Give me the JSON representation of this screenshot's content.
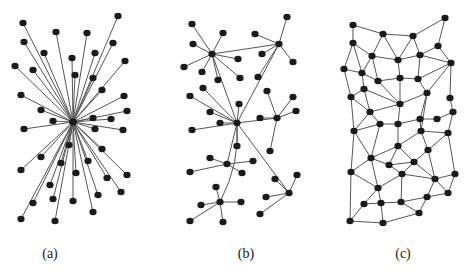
{
  "figure": {
    "colors": {
      "edge": "#555555",
      "node": "#1a1a1a",
      "background": "#ffffff"
    },
    "node_radius": 3.2,
    "panels": [
      {
        "id": "a",
        "label": "(a)",
        "label_x": 50,
        "type": "centralized",
        "hub": [
          73,
          122
        ],
        "leaves": [
          [
            23,
            23
          ],
          [
            118,
            16
          ],
          [
            56,
            32
          ],
          [
            87,
            33
          ],
          [
            24,
            42
          ],
          [
            113,
            43
          ],
          [
            44,
            53
          ],
          [
            95,
            53
          ],
          [
            72,
            58
          ],
          [
            125,
            61
          ],
          [
            15,
            66
          ],
          [
            33,
            70
          ],
          [
            75,
            75
          ],
          [
            93,
            78
          ],
          [
            102,
            90
          ],
          [
            21,
            95
          ],
          [
            124,
            96
          ],
          [
            41,
            110
          ],
          [
            127,
            111
          ],
          [
            53,
            121
          ],
          [
            93,
            118
          ],
          [
            111,
            119
          ],
          [
            24,
            129
          ],
          [
            95,
            129
          ],
          [
            123,
            130
          ],
          [
            69,
            145
          ],
          [
            102,
            149
          ],
          [
            41,
            157
          ],
          [
            61,
            163
          ],
          [
            88,
            161
          ],
          [
            21,
            170
          ],
          [
            127,
            175
          ],
          [
            76,
            173
          ],
          [
            107,
            178
          ],
          [
            50,
            185
          ],
          [
            53,
            199
          ],
          [
            121,
            192
          ],
          [
            33,
            203
          ],
          [
            73,
            201
          ],
          [
            98,
            195
          ],
          [
            93,
            212
          ],
          [
            21,
            219
          ],
          [
            55,
            221
          ]
        ]
      },
      {
        "id": "b",
        "label": "(b)",
        "label_x": 246,
        "type": "decentralized",
        "hubs": [
          {
            "at": [
              212,
              54
            ],
            "leaves": [
              [
                192,
                24
              ],
              [
                223,
                33
              ],
              [
                193,
                44
              ],
              [
                184,
                67
              ],
              [
                202,
                72
              ],
              [
                218,
                80
              ],
              [
                238,
                59
              ],
              [
                240,
                78
              ]
            ]
          },
          {
            "at": [
              279,
              44
            ],
            "leaves": [
              [
                287,
                17
              ],
              [
                255,
                34
              ],
              [
                262,
                54
              ],
              [
                293,
                62
              ],
              [
                258,
                77
              ]
            ]
          },
          {
            "at": [
              237,
              123
            ],
            "leaves": [
              [
                203,
                88
              ],
              [
                190,
                96
              ],
              [
                210,
                112
              ],
              [
                220,
                123
              ],
              [
                192,
                130
              ],
              [
                239,
                104
              ],
              [
                237,
                146
              ]
            ]
          },
          {
            "at": [
              277,
              118
            ],
            "leaves": [
              [
                267,
                91
              ],
              [
                293,
                97
              ],
              [
                296,
                111
              ],
              [
                260,
                118
              ],
              [
                270,
                151
              ]
            ]
          },
          {
            "at": [
              227,
              164
            ],
            "leaves": [
              [
                210,
                158
              ],
              [
                190,
                172
              ],
              [
                253,
                161
              ],
              [
                242,
                173
              ]
            ]
          },
          {
            "at": [
              220,
              202
            ],
            "leaves": [
              [
                216,
                187
              ],
              [
                201,
                205
              ],
              [
                241,
                202
              ],
              [
                190,
                221
              ],
              [
                223,
                222
              ]
            ]
          },
          {
            "at": [
              289,
              193
            ],
            "leaves": [
              [
                275,
                179
              ],
              [
                297,
                175
              ],
              [
                266,
                197
              ],
              [
                260,
                214
              ]
            ]
          }
        ],
        "hub_links": [
          [
            0,
            1
          ],
          [
            0,
            2
          ],
          [
            1,
            2
          ],
          [
            2,
            3
          ],
          [
            2,
            4
          ],
          [
            2,
            6
          ]
        ],
        "curved_links": [
          [
            2,
            5
          ]
        ]
      },
      {
        "id": "c",
        "label": "(c)",
        "label_x": 403,
        "type": "distributed",
        "nodes": [
          [
            353,
            25
          ],
          [
            445,
            18
          ],
          [
            383,
            34
          ],
          [
            413,
            36
          ],
          [
            353,
            43
          ],
          [
            438,
            46
          ],
          [
            372,
            56
          ],
          [
            398,
            60
          ],
          [
            420,
            55
          ],
          [
            451,
            63
          ],
          [
            344,
            69
          ],
          [
            362,
            73
          ],
          [
            378,
            81
          ],
          [
            400,
            78
          ],
          [
            418,
            79
          ],
          [
            364,
            89
          ],
          [
            427,
            93
          ],
          [
            351,
            97
          ],
          [
            450,
            98
          ],
          [
            400,
            104
          ],
          [
            370,
            112
          ],
          [
            453,
            112
          ],
          [
            420,
            119
          ],
          [
            437,
            119
          ],
          [
            380,
            124
          ],
          [
            398,
            124
          ],
          [
            354,
            131
          ],
          [
            421,
            131
          ],
          [
            448,
            133
          ],
          [
            398,
            146
          ],
          [
            428,
            150
          ],
          [
            371,
            158
          ],
          [
            389,
            165
          ],
          [
            414,
            162
          ],
          [
            351,
            172
          ],
          [
            402,
            174
          ],
          [
            455,
            174
          ],
          [
            435,
            179
          ],
          [
            378,
            188
          ],
          [
            448,
            193
          ],
          [
            427,
            197
          ],
          [
            364,
            204
          ],
          [
            381,
            203
          ],
          [
            401,
            202
          ],
          [
            419,
            213
          ],
          [
            350,
            221
          ],
          [
            383,
            223
          ]
        ],
        "edges": [
          [
            1,
            3
          ],
          [
            1,
            5
          ],
          [
            3,
            4
          ],
          [
            4,
            2
          ],
          [
            2,
            6
          ],
          [
            3,
            7
          ],
          [
            3,
            8
          ],
          [
            4,
            8
          ],
          [
            4,
            9
          ],
          [
            6,
            9
          ],
          [
            6,
            10
          ],
          [
            5,
            7
          ],
          [
            5,
            11
          ],
          [
            5,
            12
          ],
          [
            7,
            8
          ],
          [
            8,
            9
          ],
          [
            7,
            12
          ],
          [
            7,
            13
          ],
          [
            8,
            14
          ],
          [
            9,
            15
          ],
          [
            9,
            10
          ],
          [
            10,
            15
          ],
          [
            10,
            17
          ],
          [
            10,
            19
          ],
          [
            11,
            12
          ],
          [
            11,
            18
          ],
          [
            12,
            13
          ],
          [
            12,
            16
          ],
          [
            13,
            14
          ],
          [
            14,
            15
          ],
          [
            13,
            20
          ],
          [
            14,
            20
          ],
          [
            15,
            17
          ],
          [
            16,
            18
          ],
          [
            16,
            20
          ],
          [
            16,
            21
          ],
          [
            17,
            20
          ],
          [
            17,
            23
          ],
          [
            17,
            28
          ],
          [
            19,
            22
          ],
          [
            18,
            21
          ],
          [
            18,
            27
          ],
          [
            20,
            21
          ],
          [
            21,
            25
          ],
          [
            21,
            27
          ],
          [
            23,
            24
          ],
          [
            24,
            22
          ],
          [
            22,
            29
          ],
          [
            23,
            28
          ],
          [
            25,
            26
          ],
          [
            26,
            23
          ],
          [
            20,
            26
          ],
          [
            26,
            30
          ],
          [
            25,
            27
          ],
          [
            25,
            32
          ],
          [
            27,
            32
          ],
          [
            27,
            35
          ],
          [
            28,
            29
          ],
          [
            28,
            30
          ],
          [
            28,
            31
          ],
          [
            29,
            31
          ],
          [
            29,
            37
          ],
          [
            30,
            32
          ],
          [
            30,
            33
          ],
          [
            30,
            34
          ],
          [
            31,
            34
          ],
          [
            31,
            38
          ],
          [
            32,
            33
          ],
          [
            32,
            35
          ],
          [
            32,
            39
          ],
          [
            33,
            34
          ],
          [
            33,
            36
          ],
          [
            34,
            36
          ],
          [
            34,
            38
          ],
          [
            35,
            39
          ],
          [
            35,
            46
          ],
          [
            36,
            39
          ],
          [
            36,
            38
          ],
          [
            36,
            44
          ],
          [
            37,
            38
          ],
          [
            37,
            40
          ],
          [
            38,
            40
          ],
          [
            38,
            41
          ],
          [
            39,
            42
          ],
          [
            39,
            43
          ],
          [
            42,
            43
          ],
          [
            43,
            44
          ],
          [
            44,
            41
          ],
          [
            41,
            40
          ],
          [
            44,
            45
          ],
          [
            45,
            41
          ],
          [
            42,
            46
          ],
          [
            43,
            47
          ],
          [
            46,
            47
          ],
          [
            47,
            45
          ]
        ]
      }
    ]
  }
}
